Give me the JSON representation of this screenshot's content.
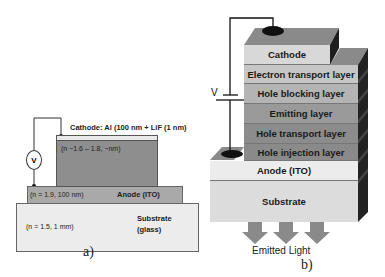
{
  "panel_a": {
    "caption": "a)",
    "cathode_label": "Cathode: Al (100 nm + LiF (1 nm)",
    "organic_label": "(n ~1.6 – 1.8, ~nm)",
    "anode_index_label": "(n = 1.9, 100 nm)",
    "anode_label": "Anode (ITO)",
    "substrate_index_label": "(n = 1.5, 1 mm)",
    "substrate_label_line1": "Substrate",
    "substrate_label_line2": "(glass)",
    "voltmeter_label": "V"
  },
  "panel_b": {
    "caption": "b)",
    "voltage_label": "V",
    "layers": [
      {
        "label": "Cathode",
        "color": "#d8d8d8"
      },
      {
        "label": "Electron transport layer",
        "color": "#c6c6c6"
      },
      {
        "label": "Hole blocking layer",
        "color": "#b4b4b4"
      },
      {
        "label": "Emitting layer",
        "color": "#9a9a9a"
      },
      {
        "label": "Hole transport layer",
        "color": "#8c8c8c"
      },
      {
        "label": "Hole injection layer",
        "color": "#8a8a8a"
      },
      {
        "label": "Anode (ITO)",
        "color": "#ececec"
      },
      {
        "label": "Substrate",
        "color": "#dcdcdc"
      }
    ],
    "emitted_light_label": "Emitted Light",
    "arrow_color": "#8a8a8a"
  }
}
